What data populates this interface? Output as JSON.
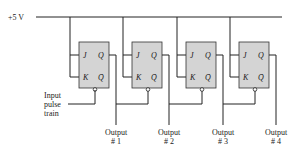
{
  "diagram": {
    "supply_label": "+5 V",
    "input_label": [
      "Input",
      "pulse",
      "train"
    ],
    "pin_labels": {
      "j": "J",
      "k": "K",
      "q": "Q",
      "qbar": "Q̄"
    },
    "flip_flops": [
      {
        "id": "ff1",
        "output_label": [
          "Output",
          "# 1"
        ]
      },
      {
        "id": "ff2",
        "output_label": [
          "Output",
          "# 2"
        ]
      },
      {
        "id": "ff3",
        "output_label": [
          "Output",
          "# 3"
        ]
      },
      {
        "id": "ff4",
        "output_label": [
          "Output",
          "# 4"
        ]
      }
    ],
    "colors": {
      "box_fill": "#d4d4d4",
      "wire": "#222222"
    }
  }
}
